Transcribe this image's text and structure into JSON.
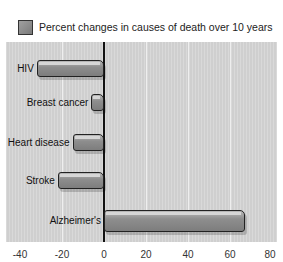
{
  "chart_data": {
    "type": "bar",
    "orientation": "horizontal",
    "title": "Percent changes in causes of death over 10 years",
    "legend": [
      "Percent changes in causes of death over 10 years"
    ],
    "legend_position": "top",
    "categories": [
      "HIV",
      "Breast cancer",
      "Heart disease",
      "Stroke",
      "Alzheimer's"
    ],
    "values": [
      -32,
      -6,
      -15,
      -22,
      67
    ],
    "xlabel": "",
    "ylabel": "",
    "xlim": [
      -40,
      80
    ],
    "xticks": [
      "-40",
      "-20",
      "0",
      "20",
      "40",
      "60",
      "80"
    ],
    "grid": true
  },
  "colors": {
    "bar": "#8e8e8e",
    "plot_bg": "#d4d4d4",
    "axis": "#111111"
  }
}
